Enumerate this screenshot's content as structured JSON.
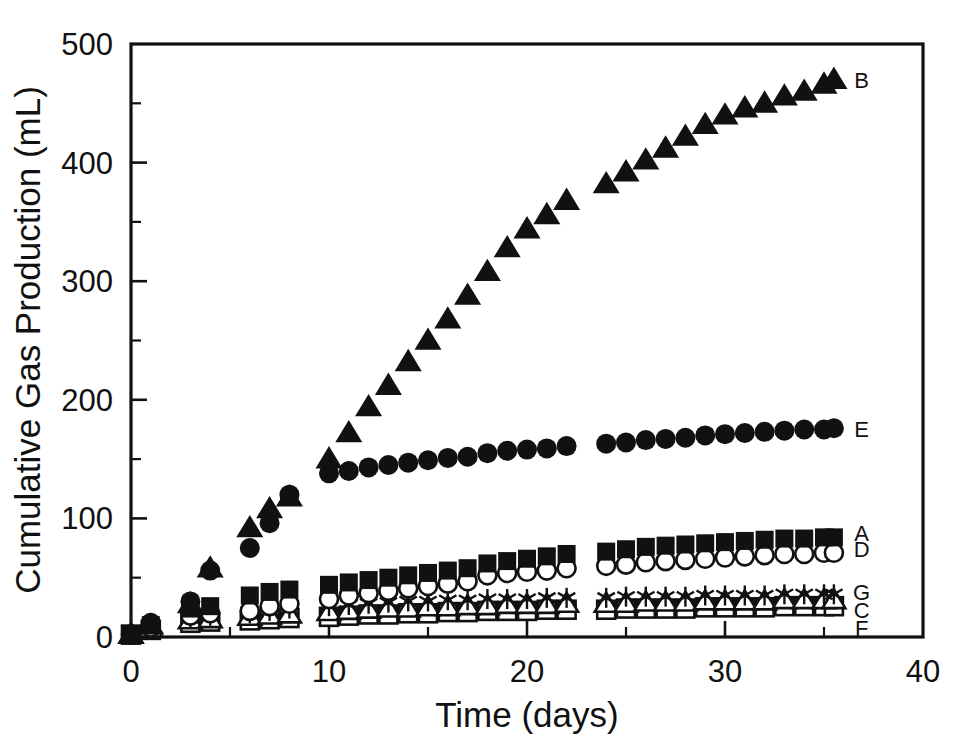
{
  "chart_data": {
    "type": "scatter",
    "title": "",
    "xlabel": "Time (days)",
    "ylabel": "Cumulative Gas Production (mL)",
    "xlim": [
      0,
      40
    ],
    "ylim": [
      0,
      500
    ],
    "xticks": [
      0,
      10,
      20,
      30,
      40
    ],
    "yticks": [
      0,
      100,
      200,
      300,
      400,
      500
    ],
    "xtick_labels": [
      "0",
      "10",
      "20",
      "30",
      "40"
    ],
    "ytick_labels": [
      "0",
      "100",
      "200",
      "300",
      "400",
      "500"
    ],
    "x_minor_ticks": [
      5,
      15,
      25,
      35
    ],
    "y_minor_ticks": [
      50,
      150,
      250,
      350,
      450
    ],
    "grid": false,
    "legend_position": "right-inline-labels",
    "series": [
      {
        "name": "B",
        "label": "B",
        "marker": "filled-triangle",
        "color": "#111111",
        "label_x": 36.9,
        "label_y": 470,
        "x": [
          0,
          1,
          3,
          4,
          6,
          7,
          8,
          10,
          11,
          12,
          13,
          14,
          15,
          16,
          17,
          18,
          19,
          20,
          21,
          22,
          24,
          25,
          26,
          27,
          28,
          29,
          30,
          31,
          32,
          33,
          34,
          35,
          35.5
        ],
        "y": [
          2,
          10,
          28,
          58,
          92,
          108,
          118,
          150,
          172,
          194,
          212,
          232,
          250,
          268,
          288,
          308,
          328,
          344,
          356,
          368,
          382,
          392,
          402,
          412,
          422,
          432,
          440,
          446,
          450,
          456,
          460,
          466,
          470
        ]
      },
      {
        "name": "E",
        "label": "E",
        "marker": "filled-circle",
        "color": "#111111",
        "label_x": 36.9,
        "label_y": 175,
        "x": [
          0,
          1,
          3,
          4,
          6,
          7,
          8,
          10,
          11,
          12,
          13,
          14,
          15,
          16,
          17,
          18,
          19,
          20,
          21,
          22,
          24,
          25,
          26,
          27,
          28,
          29,
          30,
          31,
          32,
          33,
          34,
          35,
          35.5
        ],
        "y": [
          2,
          12,
          30,
          56,
          75,
          96,
          120,
          138,
          140,
          143,
          145,
          147,
          149,
          151,
          152,
          155,
          157,
          158,
          159,
          161,
          163,
          164,
          166,
          167,
          168,
          170,
          171,
          172,
          173,
          174,
          175,
          175,
          176
        ]
      },
      {
        "name": "A",
        "label": "A",
        "marker": "filled-square",
        "color": "#111111",
        "label_x": 36.9,
        "label_y": 88,
        "x": [
          0,
          1,
          3,
          4,
          6,
          7,
          8,
          10,
          11,
          12,
          13,
          14,
          15,
          16,
          17,
          18,
          19,
          20,
          21,
          22,
          24,
          25,
          26,
          27,
          28,
          29,
          30,
          31,
          32,
          33,
          34,
          35,
          35.5
        ],
        "y": [
          2,
          10,
          24,
          26,
          35,
          38,
          40,
          44,
          46,
          48,
          50,
          52,
          54,
          56,
          58,
          62,
          64,
          66,
          68,
          70,
          72,
          74,
          76,
          77,
          78,
          79,
          80,
          81,
          82,
          83,
          83,
          84,
          84
        ]
      },
      {
        "name": "D",
        "label": "D",
        "marker": "open-circle",
        "color": "#111111",
        "label_x": 36.9,
        "label_y": 74,
        "x": [
          0,
          1,
          3,
          4,
          6,
          7,
          8,
          10,
          11,
          12,
          13,
          14,
          15,
          16,
          17,
          18,
          19,
          20,
          21,
          22,
          24,
          25,
          26,
          27,
          28,
          29,
          30,
          31,
          32,
          33,
          34,
          35,
          35.5
        ],
        "y": [
          2,
          8,
          18,
          20,
          22,
          26,
          28,
          32,
          35,
          37,
          39,
          41,
          43,
          45,
          47,
          52,
          54,
          55,
          56,
          58,
          60,
          61,
          63,
          64,
          65,
          66,
          67,
          68,
          69,
          70,
          70,
          71,
          71
        ]
      },
      {
        "name": "G",
        "label": "G",
        "marker": "asterisk",
        "color": "#111111",
        "label_x": 36.9,
        "label_y": 38,
        "x": [
          0,
          1,
          3,
          4,
          6,
          7,
          8,
          10,
          11,
          12,
          13,
          14,
          15,
          16,
          17,
          18,
          19,
          20,
          21,
          22,
          24,
          25,
          26,
          27,
          28,
          29,
          30,
          31,
          32,
          33,
          34,
          35,
          35.5
        ],
        "y": [
          2,
          9,
          16,
          18,
          20,
          22,
          24,
          26,
          27,
          28,
          29,
          30,
          30,
          31,
          31,
          32,
          32,
          32,
          33,
          33,
          33,
          34,
          34,
          34,
          34,
          35,
          35,
          35,
          35,
          36,
          36,
          36,
          36
        ]
      },
      {
        "name": "C",
        "label": "C",
        "marker": "open-triangle",
        "color": "#111111",
        "label_x": 36.9,
        "label_y": 23,
        "x": [
          0,
          1,
          3,
          4,
          6,
          7,
          8,
          10,
          11,
          12,
          13,
          14,
          15,
          16,
          17,
          18,
          19,
          20,
          21,
          22,
          24,
          25,
          26,
          27,
          28,
          29,
          30,
          31,
          32,
          33,
          34,
          35,
          35.5
        ],
        "y": [
          2,
          7,
          14,
          15,
          17,
          18,
          19,
          21,
          22,
          23,
          24,
          24,
          25,
          25,
          26,
          26,
          27,
          27,
          27,
          28,
          28,
          28,
          29,
          29,
          29,
          30,
          30,
          30,
          30,
          31,
          31,
          31,
          31
        ]
      },
      {
        "name": "F",
        "label": "F",
        "marker": "open-square",
        "color": "#111111",
        "label_x": 36.9,
        "label_y": 8,
        "x": [
          0,
          1,
          3,
          4,
          6,
          7,
          8,
          10,
          11,
          12,
          13,
          14,
          15,
          16,
          17,
          18,
          19,
          20,
          21,
          22,
          24,
          25,
          26,
          27,
          28,
          29,
          30,
          31,
          32,
          33,
          34,
          35,
          35.5
        ],
        "y": [
          2,
          6,
          12,
          13,
          14,
          15,
          16,
          17,
          18,
          19,
          19,
          20,
          20,
          21,
          21,
          22,
          22,
          22,
          23,
          23,
          23,
          24,
          24,
          24,
          24,
          25,
          25,
          25,
          25,
          26,
          26,
          26,
          26
        ]
      }
    ]
  }
}
